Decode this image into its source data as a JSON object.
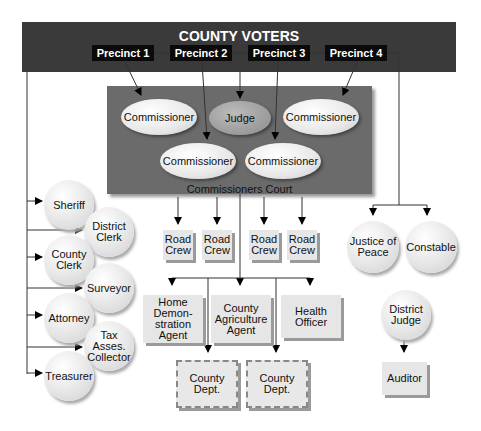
{
  "title": "COUNTY VOTERS",
  "precincts": [
    "Precinct 1",
    "Precinct 2",
    "Precinct 3",
    "Precinct 4"
  ],
  "court": {
    "label": "Commissioners Court",
    "members": [
      "Commissioner",
      "Judge",
      "Commissioner",
      "Commissioner",
      "Commissioner"
    ]
  },
  "elected_officials_left": [
    "Sheriff",
    "District Clerk",
    "County Clerk",
    "Surveyor",
    "Attorney",
    "Tax Asses. Collector",
    "Treasurer"
  ],
  "road_crews": [
    "Road Crew",
    "Road Crew",
    "Road Crew",
    "Road Crew"
  ],
  "appointed": [
    "Home Demon-stration Agent",
    "County Agriculture Agent",
    "Health Officer"
  ],
  "departments": [
    "County Dept.",
    "County Dept."
  ],
  "right_officials": [
    "Justice of Peace",
    "Constable",
    "District Judge"
  ],
  "auditor": "Auditor",
  "colors": {
    "band": "#3a3a3a",
    "precinct": "#0a0a0a",
    "court": "#6b6b6b",
    "node": "#e6e6e6",
    "judge": "#9a9a9a"
  }
}
